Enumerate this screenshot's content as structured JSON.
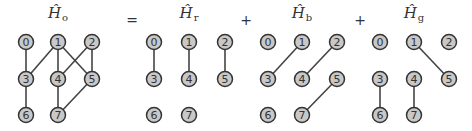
{
  "operators": [
    "=",
    "+",
    "+"
  ],
  "panels": [
    {
      "id": "Ho",
      "symbol": "Ĥ",
      "subscript": "o",
      "center_x": 58,
      "columns": [
        26,
        58,
        92
      ],
      "edges": [
        [
          0,
          3
        ],
        [
          1,
          3
        ],
        [
          1,
          4
        ],
        [
          1,
          5
        ],
        [
          2,
          4
        ],
        [
          2,
          5
        ],
        [
          3,
          6
        ],
        [
          4,
          7
        ],
        [
          5,
          7
        ]
      ]
    },
    {
      "id": "Hr",
      "symbol": "Ĥ",
      "subscript": "r",
      "center_x": 189,
      "columns": [
        154,
        189,
        225
      ],
      "edges": [
        [
          0,
          3
        ],
        [
          1,
          4
        ],
        [
          2,
          5
        ]
      ]
    },
    {
      "id": "Hb",
      "symbol": "Ĥ",
      "subscript": "b",
      "center_x": 302,
      "columns": [
        268,
        302,
        337
      ],
      "edges": [
        [
          1,
          3
        ],
        [
          2,
          4
        ],
        [
          5,
          7
        ]
      ]
    },
    {
      "id": "Hg",
      "symbol": "Ĥ",
      "subscript": "g",
      "center_x": 414,
      "columns": [
        380,
        414,
        449
      ],
      "edges": [
        [
          1,
          5
        ],
        [
          3,
          6
        ],
        [
          4,
          7
        ]
      ]
    }
  ],
  "operator_positions": [
    132,
    246,
    360
  ],
  "node_labels": [
    "0",
    "1",
    "2",
    "3",
    "4",
    "5",
    "6",
    "7"
  ],
  "rows": [
    42,
    79,
    115
  ],
  "node_grid": [
    [
      0,
      0
    ],
    [
      1,
      0
    ],
    [
      2,
      0
    ],
    [
      0,
      1
    ],
    [
      1,
      1
    ],
    [
      2,
      1
    ],
    [
      0,
      2
    ],
    [
      1,
      2
    ]
  ],
  "colors": {
    "node_fill": "#c8c8c8",
    "node_stroke": "#333333",
    "edge": "#444444"
  }
}
